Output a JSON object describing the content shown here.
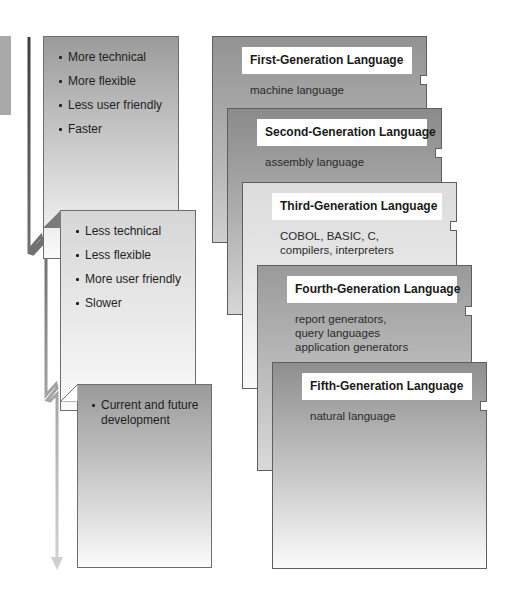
{
  "diagram": {
    "colors": {
      "card_border": "#5e5e5e",
      "dark_gray": "#8f8f8f",
      "light_gray": "#dcdcdc",
      "arrow_dark": "#4a4a4a",
      "arrow_light": "#c8c8c8",
      "title_bg": "#ffffff"
    },
    "characteristics": [
      {
        "bullets": [
          "More technical",
          "More flexible",
          "Less user friendly",
          "Faster"
        ]
      },
      {
        "bullets": [
          "Less technical",
          "Less flexible",
          "More user friendly",
          "Slower"
        ]
      },
      {
        "bullets": [
          "Current  and future\ndevelopment"
        ]
      }
    ],
    "generations": [
      {
        "title": "First-Generation Language",
        "description": "machine language"
      },
      {
        "title": "Second-Generation Language",
        "description": "assembly language"
      },
      {
        "title": "Third-Generation Language",
        "description": "COBOL, BASIC, C,\ncompilers, interpreters"
      },
      {
        "title": "Fourth-Generation Language",
        "description": "report generators,\nquery languages\napplication generators"
      },
      {
        "title": "Fifth-Generation Language",
        "description": "natural language"
      }
    ],
    "arrow": {
      "direction": "down",
      "icon": "arrow-down-icon"
    }
  }
}
